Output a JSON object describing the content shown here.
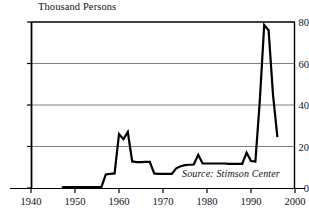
{
  "chart_data": {
    "type": "line",
    "title": "Thousand Persons",
    "ylabel": "Thousand Persons",
    "xlabel": "",
    "xlim": [
      1940,
      2000
    ],
    "ylim": [
      0,
      80
    ],
    "grid": true,
    "legend": null,
    "annotations": [
      {
        "text": "Source: Stimson Center",
        "x": 1978,
        "y": 4
      }
    ],
    "xticks": [
      1940,
      1950,
      1960,
      1970,
      1980,
      1990,
      2000
    ],
    "xtick_labels": [
      "1940",
      "1950",
      "1960",
      "1970",
      "1980",
      "1990",
      "2000"
    ],
    "yticks": [
      0,
      20,
      40,
      60,
      80
    ],
    "ytick_labels": [
      "0",
      "20",
      "40",
      "60",
      "80"
    ],
    "series": [
      {
        "name": "Thousand Persons",
        "color": "#000000",
        "x": [
          1947,
          1948,
          1949,
          1950,
          1951,
          1952,
          1953,
          1954,
          1955,
          1956,
          1957,
          1958,
          1959,
          1960,
          1961,
          1962,
          1963,
          1964,
          1965,
          1966,
          1967,
          1968,
          1969,
          1970,
          1971,
          1972,
          1973,
          1974,
          1975,
          1976,
          1977,
          1978,
          1979,
          1980,
          1981,
          1982,
          1983,
          1984,
          1985,
          1986,
          1987,
          1988,
          1989,
          1990,
          1991,
          1992,
          1993,
          1994,
          1995,
          1996
        ],
        "values": [
          0.3,
          0.4,
          0.4,
          0.4,
          0.4,
          0.4,
          0.4,
          0.4,
          0.4,
          0.4,
          6.5,
          6.8,
          7.0,
          26.0,
          23.5,
          27.0,
          12.8,
          12.5,
          12.5,
          12.6,
          12.6,
          7.0,
          6.8,
          6.8,
          6.8,
          6.8,
          9.5,
          10.5,
          11.0,
          11.2,
          11.3,
          16.0,
          11.8,
          11.8,
          11.8,
          11.8,
          11.8,
          11.8,
          11.6,
          11.6,
          11.6,
          11.6,
          17.0,
          13.0,
          12.8,
          42.0,
          78.5,
          76.0,
          45.0,
          24.5
        ]
      }
    ]
  },
  "axes": {
    "title_text": "Thousand Persons",
    "source_text": "Source: Stimson Center"
  }
}
